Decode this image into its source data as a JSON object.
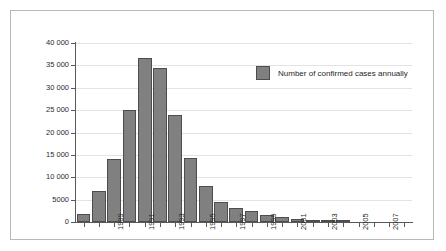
{
  "chart_data": {
    "type": "bar",
    "title": "",
    "subtitle": "",
    "xlabel": "",
    "ylabel": "",
    "ylim": [
      0,
      40000
    ],
    "ytick_values": [
      0,
      5000,
      10000,
      15000,
      20000,
      25000,
      30000,
      35000,
      40000
    ],
    "ytick_labels": [
      "0",
      "5000",
      "10 000",
      "15 000",
      "20 000",
      "25 000",
      "30 000",
      "35 000",
      "40 000"
    ],
    "grid": true,
    "legend_position": "inside-top-right",
    "legend": [
      {
        "name": "Number of confirmed cases annually",
        "color": "#808080"
      }
    ],
    "categories": [
      "1987",
      "1988",
      "1989",
      "1990",
      "1991",
      "1992",
      "1993",
      "1994",
      "1995",
      "1996",
      "1997",
      "1998",
      "1999",
      "2000",
      "2001",
      "2002",
      "2003",
      "2004",
      "2005",
      "2006",
      "2007",
      "2008"
    ],
    "xtick_labels_shown": [
      "1989",
      "1991",
      "1993",
      "1995",
      "1997",
      "1999",
      "2001",
      "2003",
      "2005",
      "2007"
    ],
    "series": [
      {
        "name": "Number of confirmed cases annually",
        "color": "#808080",
        "values": [
          1900,
          7000,
          14000,
          25100,
          36600,
          34500,
          23900,
          14300,
          8000,
          4400,
          3200,
          2400,
          1500,
          1100,
          600,
          400,
          200,
          100,
          60,
          40,
          30,
          20
        ]
      }
    ]
  },
  "colors": {
    "bar_fill": "#808080",
    "bar_stroke": "#4d4d4d",
    "gridline": "#e3e3e3",
    "axis": "#595959",
    "frame_border": "#b9b9b9",
    "text": "#2b2b2b",
    "background": "#ffffff"
  }
}
